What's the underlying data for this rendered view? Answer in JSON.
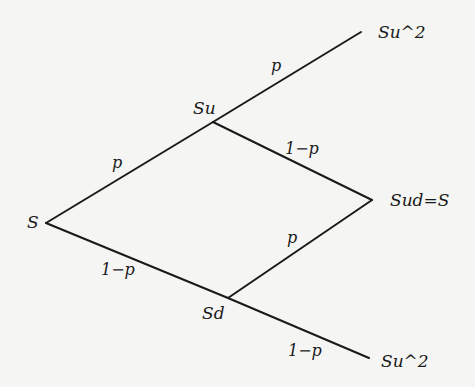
{
  "diagram": {
    "type": "binomial-tree",
    "background": "#f5f5f3",
    "line_color": "#1a1a1a",
    "nodes": {
      "root": {
        "label": "S",
        "x": 46,
        "y": 223
      },
      "up": {
        "label": "Su",
        "x": 213,
        "y": 122
      },
      "down": {
        "label": "Sd",
        "x": 228,
        "y": 298
      },
      "up_up": {
        "label": "Su^2",
        "x": 361,
        "y": 32
      },
      "up_down": {
        "label": "Sud=S",
        "x": 372,
        "y": 200
      },
      "down_down": {
        "label": "Su^2",
        "x": 369,
        "y": 358
      }
    },
    "edges": [
      {
        "from": "root",
        "to": "up",
        "label": "p"
      },
      {
        "from": "root",
        "to": "down",
        "label": "1−p"
      },
      {
        "from": "up",
        "to": "up_up",
        "label": "p"
      },
      {
        "from": "up",
        "to": "up_down",
        "label": "1−p"
      },
      {
        "from": "down",
        "to": "up_down",
        "label": "p"
      },
      {
        "from": "down",
        "to": "down_down",
        "label": "1−p"
      }
    ]
  }
}
